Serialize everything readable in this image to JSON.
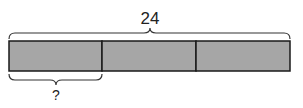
{
  "diagram": {
    "type": "tape-diagram",
    "total_label": "24",
    "part_label": "?",
    "parts": 3,
    "fill_color": "#a6a6a6",
    "stroke_color": "#1a1a1a"
  }
}
